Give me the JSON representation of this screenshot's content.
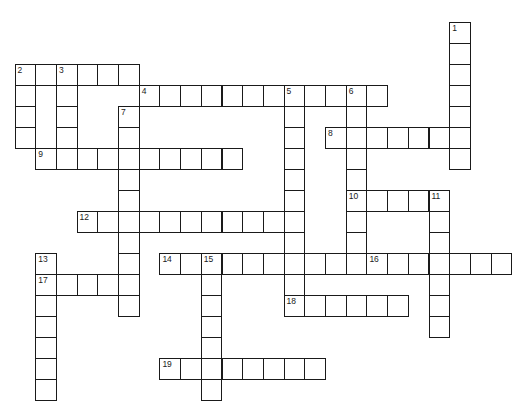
{
  "puzzle": {
    "type": "crossword",
    "grid": {
      "origin_x": 15,
      "origin_y": 64,
      "cell_w": 20.7,
      "cell_h": 21,
      "line_color": "#1a1a1a",
      "fill_color": "#ffffff"
    },
    "entries": [
      {
        "num": "1",
        "dir": "down",
        "col": 21,
        "row": -2,
        "len": 7
      },
      {
        "num": "2",
        "dir": "across",
        "col": 0,
        "row": 0,
        "len": 6
      },
      {
        "num": "2",
        "dir": "down",
        "col": 0,
        "row": 0,
        "len": 4
      },
      {
        "num": "3",
        "dir": "down",
        "col": 2,
        "row": 0,
        "len": 4
      },
      {
        "num": "4",
        "dir": "across",
        "col": 6,
        "row": 1,
        "len": 12
      },
      {
        "num": "5",
        "dir": "down",
        "col": 13,
        "row": 1,
        "len": 11
      },
      {
        "num": "6",
        "dir": "down",
        "col": 16,
        "row": 1,
        "len": 9
      },
      {
        "num": "7",
        "dir": "down",
        "col": 5,
        "row": 2,
        "len": 10
      },
      {
        "num": "8",
        "dir": "across",
        "col": 15,
        "row": 3,
        "len": 7
      },
      {
        "num": "9",
        "dir": "across",
        "col": 1,
        "row": 4,
        "len": 10
      },
      {
        "num": "10",
        "dir": "across",
        "col": 16,
        "row": 6,
        "len": 5
      },
      {
        "num": "11",
        "dir": "down",
        "col": 20,
        "row": 6,
        "len": 7
      },
      {
        "num": "12",
        "dir": "across",
        "col": 3,
        "row": 7,
        "len": 11
      },
      {
        "num": "13",
        "dir": "down",
        "col": 1,
        "row": 9,
        "len": 7
      },
      {
        "num": "14",
        "dir": "across",
        "col": 7,
        "row": 9,
        "len": 9
      },
      {
        "num": "15",
        "dir": "down",
        "col": 9,
        "row": 9,
        "len": 7
      },
      {
        "num": "16",
        "dir": "across",
        "col": 17,
        "row": 9,
        "len": 7
      },
      {
        "num": "17",
        "dir": "across",
        "col": 1,
        "row": 10,
        "len": 5
      },
      {
        "num": "18",
        "dir": "across",
        "col": 13,
        "row": 11,
        "len": 6
      },
      {
        "num": "19",
        "dir": "across",
        "col": 7,
        "row": 14,
        "len": 8
      }
    ]
  }
}
